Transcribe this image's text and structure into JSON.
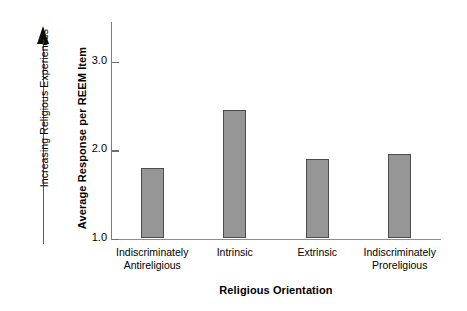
{
  "annotation": {
    "arrow_caption": "Increasing Religious Experiences",
    "arrow_icon": "up-arrow-icon"
  },
  "chart_data": {
    "type": "bar",
    "title": "",
    "xlabel": "Religious Orientation",
    "ylabel": "Average Response per REEM Item",
    "categories": [
      "Indiscriminately Antireligious",
      "Intrinsic",
      "Extrinsic",
      "Indiscriminately Proreligious"
    ],
    "category_lines": [
      [
        "Indiscriminately",
        "Antireligious"
      ],
      [
        "Intrinsic",
        ""
      ],
      [
        "Extrinsic",
        ""
      ],
      [
        "Indiscriminately",
        "Proreligious"
      ]
    ],
    "values": [
      1.8,
      2.45,
      1.9,
      1.96
    ],
    "ylim": [
      1.0,
      3.45
    ],
    "yticks": [
      1.0,
      2.0,
      3.0
    ],
    "ytick_labels": [
      "1.0",
      "2.0",
      "3.0"
    ],
    "baseline": 1.0,
    "grid": false,
    "legend": false,
    "bar_color": "#969696",
    "bar_edge_color": "#4c4c4c",
    "axis_color": "#7b7b7b"
  }
}
